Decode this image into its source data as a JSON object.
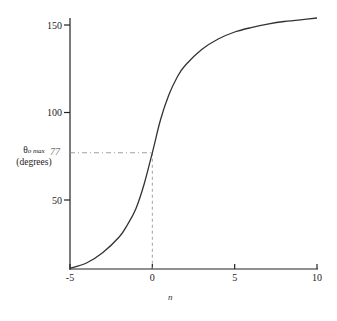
{
  "chart_data": {
    "type": "line",
    "title": "",
    "xlabel": "n",
    "ylabel": "θo max (degrees)",
    "ylabel_parts": {
      "symbol": "θ",
      "subscript": "o max",
      "units": "(degrees)"
    },
    "xlim": [
      -5,
      10
    ],
    "ylim": [
      10,
      155
    ],
    "x_ticks": [
      -5,
      0,
      5,
      10
    ],
    "x_tick_labels": [
      "-5",
      "0",
      "5",
      "10"
    ],
    "y_ticks": [
      50,
      100,
      150
    ],
    "y_tick_labels": [
      "50",
      "100",
      "150"
    ],
    "grid": false,
    "legend": null,
    "series": [
      {
        "name": "θo max vs n",
        "x": [
          -5,
          -4,
          -3,
          -2,
          -1.5,
          -1,
          -0.5,
          0,
          0.5,
          1,
          1.5,
          2,
          3,
          4,
          5,
          6,
          7,
          8,
          9,
          10
        ],
        "y": [
          11,
          14,
          20,
          29,
          36,
          45,
          59,
          77,
          96,
          110,
          120,
          127,
          136,
          142,
          146,
          148.5,
          150.5,
          152,
          153,
          154
        ]
      }
    ],
    "annotations": [
      {
        "type": "reference_point",
        "x": 0,
        "y": 77,
        "label": "77",
        "style": "dashed guide lines to both axes"
      }
    ]
  }
}
